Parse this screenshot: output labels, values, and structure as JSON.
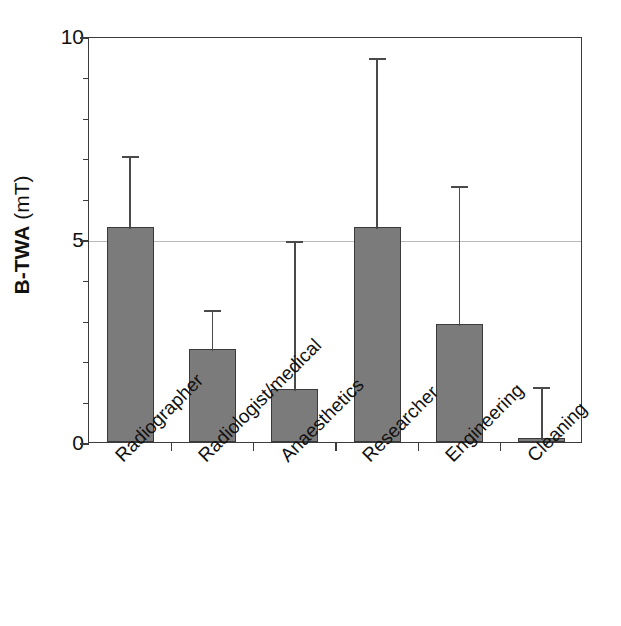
{
  "chart_data": {
    "type": "bar",
    "title": "",
    "xlabel": "",
    "ylabel_bold": "B-TWA",
    "ylabel_unit": " (mT)",
    "ylabel_full": "B-TWA (mT)",
    "ylim": [
      0,
      10
    ],
    "ytick_labels": [
      "0",
      "5",
      "10"
    ],
    "ytick_values": [
      0,
      5,
      10
    ],
    "yminor_step": 1,
    "grid": "horizontal gridline at y=5 only",
    "legend": "none",
    "bar_color": "#7b7b7b",
    "bar_edge_color": "#3a3a3a",
    "error_color": "#4a4a4a",
    "frame_color": "#3b3b3b",
    "gridline_color": "#b9b9b9",
    "categories": [
      "Radiographer",
      "Radiologist/medical",
      "Anaesthetics",
      "Researcher",
      "Engineering",
      "Cleaning"
    ],
    "values": [
      5.3,
      2.3,
      1.3,
      5.3,
      2.9,
      0.1
    ],
    "error_upper": [
      7.1,
      3.3,
      5.0,
      9.5,
      6.35,
      1.4
    ],
    "series": [
      {
        "name": "B-TWA",
        "values": [
          5.3,
          2.3,
          1.3,
          5.3,
          2.9,
          0.1
        ],
        "error_upper": [
          7.1,
          3.3,
          5.0,
          9.5,
          6.35,
          1.4
        ]
      }
    ]
  }
}
